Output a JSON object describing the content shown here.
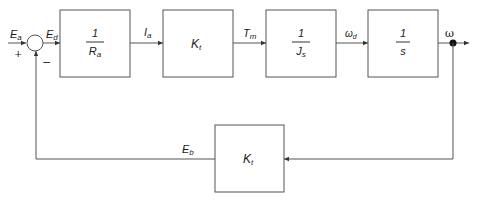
{
  "diagram": {
    "type": "block-diagram",
    "input_label": "E_a",
    "input_label_main": "E",
    "input_label_sub": "a",
    "plus_sign": "+",
    "minus_sign": "−",
    "error_label_main": "E",
    "error_label_sub": "d",
    "blocks": [
      {
        "id": "armature",
        "num": "1",
        "den_main": "R",
        "den_sub": "a",
        "text": "1/Ra"
      },
      {
        "id": "torque-constant",
        "main": "K",
        "sub": "t",
        "text": "Kt"
      },
      {
        "id": "inertia",
        "num": "1",
        "den_main": "J",
        "den_sub": "s",
        "text": "1/Js"
      },
      {
        "id": "integrator",
        "num": "1",
        "den_main": "s",
        "text": "1/s"
      }
    ],
    "feedback_block": {
      "id": "back-emf",
      "main": "K",
      "sub": "t",
      "text": "Kt"
    },
    "signals": [
      {
        "main": "I",
        "sub": "a"
      },
      {
        "main": "T",
        "sub": "m"
      },
      {
        "main": "ω",
        "sub": "d"
      },
      {
        "main": "ω",
        "sub": ""
      }
    ],
    "feedback_signal": {
      "main": "E",
      "sub": "b"
    },
    "colors": {
      "line": "#555555",
      "text": "#1a1a1a",
      "background": "#ffffff"
    }
  }
}
